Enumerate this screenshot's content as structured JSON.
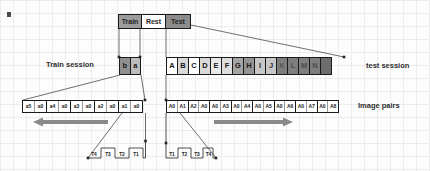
{
  "timeline": [
    {
      "label": "Train",
      "bg": "#9c9c9c"
    },
    {
      "label": "Rest",
      "bg": "#ffffff"
    },
    {
      "label": "Test",
      "bg": "#8c8c8c"
    }
  ],
  "session_labels": {
    "train": "Train session",
    "test": "test session",
    "image_pairs": "Image pairs"
  },
  "train_blocks": [
    {
      "label": "b",
      "bg": "#8f8f8f",
      "fg": "#151515"
    },
    {
      "label": "a",
      "bg": "#bcbcbc",
      "fg": "#151515"
    }
  ],
  "test_blocks": [
    {
      "label": "A",
      "bg": "#ffffff",
      "fg": "#161616"
    },
    {
      "label": "B",
      "bg": "#d9d9d9",
      "fg": "#161616"
    },
    {
      "label": "C",
      "bg": "#ffffff",
      "fg": "#161616"
    },
    {
      "label": "D",
      "bg": "#d9d9d9",
      "fg": "#161616"
    },
    {
      "label": "E",
      "bg": "#e9e9e9",
      "fg": "#161616"
    },
    {
      "label": "F",
      "bg": "#dedede",
      "fg": "#161616"
    },
    {
      "label": "G",
      "bg": "#a5a5a5",
      "fg": "#161616"
    },
    {
      "label": "H",
      "bg": "#949494",
      "fg": "#1d1d1d"
    },
    {
      "label": "I",
      "bg": "#c7c7c7",
      "fg": "#2a2a2a"
    },
    {
      "label": "J",
      "bg": "#c7c7c7",
      "fg": "#2a2a2a"
    },
    {
      "label": "K",
      "bg": "#7e7e7e",
      "fg": "#565656"
    },
    {
      "label": "L",
      "bg": "#7e7e7e",
      "fg": "#4c4c4c"
    },
    {
      "label": "M",
      "bg": "#7e7e7e",
      "fg": "#4c4c4c"
    },
    {
      "label": "N",
      "bg": "#7e7e7e",
      "fg": "#4c4c4c"
    },
    {
      "label": "",
      "bg": "#6d6d6d",
      "fg": "#6d6d6d"
    }
  ],
  "left_pairs": [
    [
      "a5",
      "a0"
    ],
    [
      "a4",
      "a0"
    ],
    [
      "a3",
      "a0"
    ],
    [
      "a2",
      "a0"
    ],
    [
      "a1",
      "a0"
    ]
  ],
  "right_pairs": [
    [
      "A0",
      "A1"
    ],
    [
      "A2",
      "A0"
    ],
    [
      "A0",
      "A3"
    ],
    [
      "A0",
      "A4"
    ],
    [
      "A0",
      "A5"
    ],
    [
      "A0",
      "A6"
    ],
    [
      "A0",
      "A7"
    ],
    [
      "A0",
      "A8"
    ]
  ],
  "waves": {
    "left": {
      "labels": [
        "T4",
        "T3",
        "T2",
        "T1"
      ]
    },
    "right": {
      "labels": [
        "T1",
        "T2",
        "T3",
        "T4"
      ]
    }
  },
  "colors": {
    "arrow": "#8a8a8a",
    "line": "#4a4a4a",
    "wave": "#3a3a3a"
  }
}
